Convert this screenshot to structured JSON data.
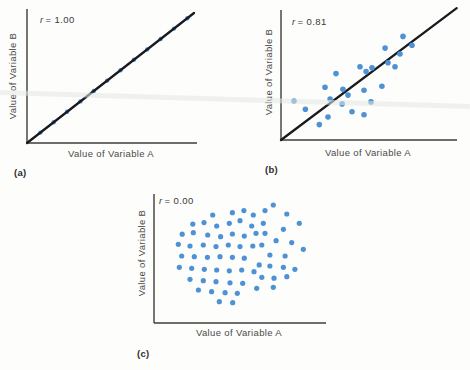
{
  "figure": {
    "background": "#fdfdfc",
    "dot_color": "#4e92d5",
    "trend_line_color": "#191a20",
    "axis_color": "#3c3c3c",
    "text_color": "#4a4a4a"
  },
  "chart_data": [
    {
      "type": "scatter",
      "panel_label": "(a)",
      "correlation_var": "r",
      "correlation_eq": "= 1.00",
      "r": 1.0,
      "xlabel": "Value of Variable A",
      "ylabel": "Value of Variable B",
      "has_trend_line": true,
      "axis_ticks": "none",
      "points": [
        [
          0.08,
          0.08
        ],
        [
          0.16,
          0.16
        ],
        [
          0.24,
          0.24
        ],
        [
          0.32,
          0.32
        ],
        [
          0.4,
          0.4
        ],
        [
          0.48,
          0.48
        ],
        [
          0.56,
          0.56
        ],
        [
          0.64,
          0.64
        ],
        [
          0.72,
          0.72
        ],
        [
          0.8,
          0.8
        ],
        [
          0.88,
          0.88
        ],
        [
          0.96,
          0.96
        ]
      ]
    },
    {
      "type": "scatter",
      "panel_label": "(b)",
      "correlation_var": "r",
      "correlation_eq": "= 0.81",
      "r": 0.81,
      "xlabel": "Value of Variable A",
      "ylabel": "Value of Variable B",
      "has_trend_line": true,
      "axis_ticks": "none",
      "points": [
        [
          0.075,
          0.305
        ],
        [
          0.14,
          0.24
        ],
        [
          0.22,
          0.12
        ],
        [
          0.253,
          0.412
        ],
        [
          0.282,
          0.32
        ],
        [
          0.27,
          0.18
        ],
        [
          0.316,
          0.519
        ],
        [
          0.356,
          0.397
        ],
        [
          0.385,
          0.351
        ],
        [
          0.351,
          0.282
        ],
        [
          0.408,
          0.221
        ],
        [
          0.517,
          0.298
        ],
        [
          0.454,
          0.573
        ],
        [
          0.489,
          0.534
        ],
        [
          0.477,
          0.389
        ],
        [
          0.477,
          0.198
        ],
        [
          0.523,
          0.565
        ],
        [
          0.58,
          0.42
        ],
        [
          0.598,
          0.718
        ],
        [
          0.615,
          0.603
        ],
        [
          0.655,
          0.573
        ],
        [
          0.684,
          0.672
        ],
        [
          0.701,
          0.809
        ],
        [
          0.753,
          0.74
        ]
      ]
    },
    {
      "type": "scatter",
      "panel_label": "(c)",
      "correlation_var": "r",
      "correlation_eq": "= 0.00",
      "r": 0.0,
      "xlabel": "Value of Variable A",
      "ylabel": "Value of Variable B",
      "has_trend_line": false,
      "axis_ticks": "none",
      "points": [
        [
          0.345,
          0.837
        ],
        [
          0.461,
          0.855
        ],
        [
          0.529,
          0.871
        ],
        [
          0.584,
          0.837
        ],
        [
          0.653,
          0.871
        ],
        [
          0.228,
          0.767
        ],
        [
          0.294,
          0.778
        ],
        [
          0.369,
          0.752
        ],
        [
          0.443,
          0.773
        ],
        [
          0.506,
          0.793
        ],
        [
          0.575,
          0.752
        ],
        [
          0.643,
          0.773
        ],
        [
          0.166,
          0.688
        ],
        [
          0.231,
          0.7
        ],
        [
          0.316,
          0.682
        ],
        [
          0.392,
          0.669
        ],
        [
          0.461,
          0.69
        ],
        [
          0.531,
          0.674
        ],
        [
          0.6,
          0.695
        ],
        [
          0.143,
          0.61
        ],
        [
          0.212,
          0.597
        ],
        [
          0.29,
          0.605
        ],
        [
          0.365,
          0.592
        ],
        [
          0.437,
          0.605
        ],
        [
          0.506,
          0.592
        ],
        [
          0.581,
          0.597
        ],
        [
          0.163,
          0.519
        ],
        [
          0.237,
          0.514
        ],
        [
          0.314,
          0.509
        ],
        [
          0.388,
          0.514
        ],
        [
          0.461,
          0.509
        ],
        [
          0.531,
          0.502
        ],
        [
          0.149,
          0.432
        ],
        [
          0.222,
          0.424
        ],
        [
          0.296,
          0.416
        ],
        [
          0.369,
          0.411
        ],
        [
          0.443,
          0.405
        ],
        [
          0.516,
          0.411
        ],
        [
          0.588,
          0.398
        ],
        [
          0.212,
          0.339
        ],
        [
          0.29,
          0.328
        ],
        [
          0.365,
          0.32
        ],
        [
          0.447,
          0.312
        ],
        [
          0.522,
          0.308
        ],
        [
          0.261,
          0.256
        ],
        [
          0.339,
          0.243
        ],
        [
          0.418,
          0.235
        ],
        [
          0.49,
          0.23
        ],
        [
          0.384,
          0.165
        ],
        [
          0.463,
          0.157
        ],
        [
          0.702,
          0.915
        ],
        [
          0.781,
          0.845
        ],
        [
          0.855,
          0.773
        ],
        [
          0.761,
          0.726
        ],
        [
          0.653,
          0.695
        ],
        [
          0.718,
          0.638
        ],
        [
          0.81,
          0.623
        ],
        [
          0.634,
          0.605
        ],
        [
          0.878,
          0.571
        ],
        [
          0.682,
          0.527
        ],
        [
          0.771,
          0.519
        ],
        [
          0.619,
          0.45
        ],
        [
          0.682,
          0.442
        ],
        [
          0.761,
          0.432
        ],
        [
          0.829,
          0.416
        ],
        [
          0.634,
          0.354
        ],
        [
          0.706,
          0.347
        ],
        [
          0.781,
          0.359
        ],
        [
          0.604,
          0.269
        ],
        [
          0.702,
          0.277
        ]
      ]
    }
  ]
}
